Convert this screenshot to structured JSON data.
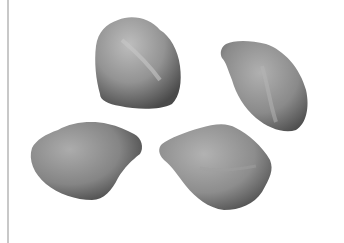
{
  "image": {
    "description": "Grayscale photograph of four seeds on a white background",
    "background_color": "#ffffff",
    "edge_line_color": "#c8c8c8",
    "seed_light": "#b4b4b4",
    "seed_mid": "#8c8c8c",
    "seed_dark": "#505050",
    "seeds": [
      {
        "id": "top-left",
        "position": "upper center-left"
      },
      {
        "id": "top-right",
        "position": "upper right"
      },
      {
        "id": "bottom-left",
        "position": "lower left"
      },
      {
        "id": "bottom-right",
        "position": "lower center"
      }
    ]
  }
}
